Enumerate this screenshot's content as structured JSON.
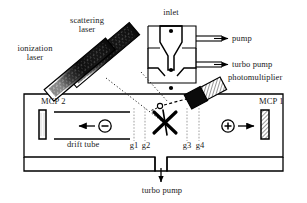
{
  "diagram": {
    "colors": {
      "ink": "#000000",
      "grid_line": "#a8a8a8",
      "dotted_beam": "#2b2b2b",
      "hatch": "#555555",
      "background": "#ffffff"
    }
  },
  "labels": {
    "ionization_laser": "ionization\nlaser",
    "ionization_laser_line1": "ionization",
    "ionization_laser_line2": "laser",
    "scattering_laser_line1": "scattering",
    "scattering_laser_line2": "laser",
    "inlet": "inlet",
    "pump": "pump",
    "turbo_pump_right": "turbo pump",
    "photomultiplier": "photomultiplier",
    "mcp2": "MCP 2",
    "mcp1": "MCP 1",
    "drift_tube": "drift tube",
    "g1": "g1",
    "g2": "g2",
    "g3": "g3",
    "g4": "g4",
    "turbo_pump_bottom": "turbo pump",
    "negative_ion": "−",
    "positive_ion": "+"
  },
  "components": {
    "lasers": [
      {
        "name": "ionization-laser",
        "angle_deg": -40,
        "label": "ionization laser"
      },
      {
        "name": "scattering-laser",
        "angle_deg": -40,
        "label": "scattering laser"
      }
    ],
    "grids": [
      "g1",
      "g2",
      "g3",
      "g4"
    ],
    "detectors": [
      {
        "name": "MCP 2",
        "polarity": "negative",
        "fill": "plain"
      },
      {
        "name": "MCP 1",
        "polarity": "positive",
        "fill": "hatched"
      }
    ],
    "pump_ports": [
      "pump",
      "turbo pump",
      "turbo pump"
    ]
  }
}
